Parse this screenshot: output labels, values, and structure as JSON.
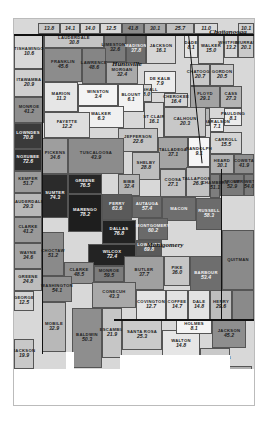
{
  "map": {
    "title": "Alabama counties choropleth",
    "cities": [
      {
        "name": "Chattanooga",
        "x": 214,
        "y": 13
      },
      {
        "name": "Huntsville",
        "x": 113,
        "y": 45
      },
      {
        "name": "Montgomery",
        "x": 151,
        "y": 226
      }
    ],
    "regions": [
      {
        "name": "",
        "value": "13.8",
        "x": 24,
        "y": 4,
        "w": 22,
        "h": 11,
        "fill": "#c8c8c8"
      },
      {
        "name": "",
        "value": "14.1",
        "x": 46,
        "y": 4,
        "w": 20,
        "h": 11,
        "fill": "#d0d0d0"
      },
      {
        "name": "",
        "value": "14.0",
        "x": 66,
        "y": 4,
        "w": 20,
        "h": 11,
        "fill": "#d4d4d4"
      },
      {
        "name": "",
        "value": "12.5",
        "x": 86,
        "y": 4,
        "w": 22,
        "h": 11,
        "fill": "#d8d8d8"
      },
      {
        "name": "",
        "value": "41.8",
        "x": 108,
        "y": 4,
        "w": 22,
        "h": 11,
        "fill": "#8a8a8a"
      },
      {
        "name": "",
        "value": "30.1",
        "x": 130,
        "y": 4,
        "w": 22,
        "h": 11,
        "fill": "#a8a8a8"
      },
      {
        "name": "",
        "value": "25.7",
        "x": 152,
        "y": 4,
        "w": 28,
        "h": 11,
        "fill": "#c0c0c0"
      },
      {
        "name": "",
        "value": "11.0",
        "x": 180,
        "y": 4,
        "w": 24,
        "h": 11,
        "fill": "#d8d8d8"
      },
      {
        "name": "",
        "value": "10.1",
        "x": 224,
        "y": 4,
        "w": 16,
        "h": 11,
        "fill": "#d0d0d0"
      },
      {
        "name": "TISHAMINGO",
        "value": "10.6",
        "x": 0,
        "y": 15,
        "w": 30,
        "h": 35,
        "fill": "#d8d8d8"
      },
      {
        "name": "ITAWAMBA",
        "value": "20.9",
        "x": 0,
        "y": 50,
        "w": 30,
        "h": 28,
        "fill": "#cfcfcf"
      },
      {
        "name": "MONROE",
        "value": "41.2",
        "x": 0,
        "y": 78,
        "w": 30,
        "h": 26,
        "fill": "#8e8e8e"
      },
      {
        "name": "LOWNDES",
        "value": "70.8",
        "x": 0,
        "y": 104,
        "w": 28,
        "h": 26,
        "fill": "#3a3a3a"
      },
      {
        "name": "NOXUBEE",
        "value": "72.6",
        "x": 0,
        "y": 130,
        "w": 28,
        "h": 22,
        "fill": "#2e2e2e"
      },
      {
        "name": "KEMPER",
        "value": "51.7",
        "x": 0,
        "y": 152,
        "w": 28,
        "h": 22,
        "fill": "#9a9a9a"
      },
      {
        "name": "LAUDERDALE",
        "value": "29.3",
        "x": 0,
        "y": 174,
        "w": 28,
        "h": 24,
        "fill": "#b8b8b8"
      },
      {
        "name": "CLARKE",
        "value": "41.2",
        "x": 0,
        "y": 198,
        "w": 28,
        "h": 26,
        "fill": "#999999"
      },
      {
        "name": "WAYNE",
        "value": "34.6",
        "x": 0,
        "y": 224,
        "w": 28,
        "h": 26,
        "fill": "#a4a4a4"
      },
      {
        "name": "GREENE",
        "value": "24.8",
        "x": 0,
        "y": 250,
        "w": 28,
        "h": 22,
        "fill": "#bdbdbd"
      },
      {
        "name": "GEORGE",
        "value": "12.5",
        "x": 0,
        "y": 272,
        "w": 20,
        "h": 20,
        "fill": "#d4d4d4"
      },
      {
        "name": "JACKSON",
        "value": "19.9",
        "x": 0,
        "y": 320,
        "w": 20,
        "h": 30,
        "fill": "#c8c8c8"
      },
      {
        "name": "LAUDERDALE",
        "value": "30.8",
        "x": 30,
        "y": 15,
        "w": 60,
        "h": 14,
        "fill": "#c4c4c4"
      },
      {
        "name": "LIMESTONE",
        "value": "32.6",
        "x": 90,
        "y": 15,
        "w": 22,
        "h": 28,
        "fill": "#7c7c7c"
      },
      {
        "name": "MADISON",
        "value": "37.8",
        "x": 112,
        "y": 15,
        "w": 20,
        "h": 30,
        "fill": "#6e6e6e"
      },
      {
        "name": "JACKSON",
        "value": "16.1",
        "x": 132,
        "y": 15,
        "w": 30,
        "h": 30,
        "fill": "#d6d6d6"
      },
      {
        "name": "DADE",
        "value": "8.1",
        "x": 170,
        "y": 15,
        "w": 14,
        "h": 24,
        "fill": "#e4e4e4"
      },
      {
        "name": "WALKER",
        "value": "15.0",
        "x": 184,
        "y": 15,
        "w": 26,
        "h": 30,
        "fill": "#d6d6d6"
      },
      {
        "name": "WHITFIELD",
        "value": "13.2",
        "x": 210,
        "y": 15,
        "w": 14,
        "h": 24,
        "fill": "#d8d8d8"
      },
      {
        "name": "MURRAY",
        "value": "20.1",
        "x": 224,
        "y": 15,
        "w": 16,
        "h": 24,
        "fill": "#cacaca"
      },
      {
        "name": "FRANKLIN",
        "value": "45.6",
        "x": 30,
        "y": 29,
        "w": 38,
        "h": 34,
        "fill": "#8c8c8c"
      },
      {
        "name": "LAWRENCE",
        "value": "48.6",
        "x": 68,
        "y": 29,
        "w": 24,
        "h": 36,
        "fill": "#858585"
      },
      {
        "name": "MORGAN",
        "value": "32.4",
        "x": 92,
        "y": 43,
        "w": 32,
        "h": 22,
        "fill": "#a9a9a9"
      },
      {
        "name": "DE KALB",
        "value": "7.9",
        "x": 130,
        "y": 52,
        "w": 32,
        "h": 22,
        "fill": "#ececec"
      },
      {
        "name": "MARSHALL",
        "value": "18.0",
        "x": 124,
        "y": 65,
        "w": 14,
        "h": 18,
        "fill": "#d3d3d3"
      },
      {
        "name": "CHEROKEE",
        "value": "16.4",
        "x": 150,
        "y": 74,
        "w": 24,
        "h": 14,
        "fill": "#d6d6d6"
      },
      {
        "name": "CHATOOGA",
        "value": "20.7",
        "x": 176,
        "y": 45,
        "w": 20,
        "h": 22,
        "fill": "#c8c8c8"
      },
      {
        "name": "GORDON",
        "value": "20.5",
        "x": 196,
        "y": 45,
        "w": 24,
        "h": 22,
        "fill": "#c9c9c9"
      },
      {
        "name": "FLOYD",
        "value": "29.1",
        "x": 176,
        "y": 67,
        "w": 30,
        "h": 22,
        "fill": "#a2a2a2"
      },
      {
        "name": "CASS",
        "value": "27.3",
        "x": 206,
        "y": 67,
        "w": 22,
        "h": 22,
        "fill": "#b4b4b4"
      },
      {
        "name": "PAULDING",
        "value": "8.1",
        "x": 210,
        "y": 89,
        "w": 18,
        "h": 18,
        "fill": "#ececec"
      },
      {
        "name": "POLK",
        "value": "26.8",
        "x": 176,
        "y": 89,
        "w": 20,
        "h": 18,
        "fill": "#b7b7b7"
      },
      {
        "name": "HARALSON",
        "value": "7.1",
        "x": 196,
        "y": 99,
        "w": 14,
        "h": 14,
        "fill": "#eeeeee"
      },
      {
        "name": "CARROLL",
        "value": "15.5",
        "x": 196,
        "y": 113,
        "w": 32,
        "h": 22,
        "fill": "#d4d4d4"
      },
      {
        "name": "HEARD",
        "value": "30.1",
        "x": 196,
        "y": 135,
        "w": 24,
        "h": 20,
        "fill": "#b0b0b0"
      },
      {
        "name": "COWETA",
        "value": "41.9",
        "x": 220,
        "y": 135,
        "w": 20,
        "h": 20,
        "fill": "#8e8e8e"
      },
      {
        "name": "TROUP",
        "value": "52.9",
        "x": 206,
        "y": 155,
        "w": 24,
        "h": 22,
        "fill": "#7a7a7a"
      },
      {
        "name": "MERIWETHER",
        "value": "54.0",
        "x": 230,
        "y": 155,
        "w": 10,
        "h": 22,
        "fill": "#7a7a7a"
      },
      {
        "name": "MARION",
        "value": "11.3",
        "x": 30,
        "y": 63,
        "w": 34,
        "h": 30,
        "fill": "#e6e6e6"
      },
      {
        "name": "WINSTON",
        "value": "3.4",
        "x": 64,
        "y": 65,
        "w": 40,
        "h": 22,
        "fill": "#f4f4f4"
      },
      {
        "name": "BLOUNT",
        "value": "6.1",
        "x": 104,
        "y": 65,
        "w": 26,
        "h": 28,
        "fill": "#f2f2f2"
      },
      {
        "name": "WALKER",
        "value": "6.3",
        "x": 64,
        "y": 87,
        "w": 46,
        "h": 22,
        "fill": "#f0f0f0"
      },
      {
        "name": "FAYETTE",
        "value": "12.2",
        "x": 30,
        "y": 93,
        "w": 46,
        "h": 26,
        "fill": "#dedede"
      },
      {
        "name": "ST CLAIR",
        "value": "16.1",
        "x": 130,
        "y": 83,
        "w": 20,
        "h": 36,
        "fill": "#d9d9d9"
      },
      {
        "name": "CALHOUN",
        "value": "20.3",
        "x": 150,
        "y": 88,
        "w": 42,
        "h": 30,
        "fill": "#c8c8c8"
      },
      {
        "name": "JEFFERSON",
        "value": "22.6",
        "x": 104,
        "y": 109,
        "w": 40,
        "h": 24,
        "fill": "#c4c4c4"
      },
      {
        "name": "PICKENS",
        "value": "34.6",
        "x": 28,
        "y": 119,
        "w": 26,
        "h": 36,
        "fill": "#9e9e9e"
      },
      {
        "name": "TUSCALOOSA",
        "value": "43.9",
        "x": 54,
        "y": 119,
        "w": 56,
        "h": 36,
        "fill": "#8c8c8c"
      },
      {
        "name": "TALLADEGA",
        "value": "37.1",
        "x": 144,
        "y": 118,
        "w": 30,
        "h": 32,
        "fill": "#a4a4a4"
      },
      {
        "name": "RANDOLPH",
        "value": "9.1",
        "x": 174,
        "y": 118,
        "w": 22,
        "h": 30,
        "fill": "#f6f6f6"
      },
      {
        "name": "SHELBY",
        "value": "28.8",
        "x": 118,
        "y": 133,
        "w": 28,
        "h": 28,
        "fill": "#bdbdbd"
      },
      {
        "name": "BIBB",
        "value": "32.4",
        "x": 104,
        "y": 155,
        "w": 22,
        "h": 22,
        "fill": "#b4b4b4"
      },
      {
        "name": "COOSA",
        "value": "27.1",
        "x": 146,
        "y": 150,
        "w": 26,
        "h": 28,
        "fill": "#c2c2c2"
      },
      {
        "name": "TALLAPOOSA",
        "value": "26.9",
        "x": 172,
        "y": 148,
        "w": 24,
        "h": 30,
        "fill": "#c2c2c2"
      },
      {
        "name": "CHAMBERS",
        "value": "51.1",
        "x": 196,
        "y": 155,
        "w": 10,
        "h": 24,
        "fill": "#7e7e7e"
      },
      {
        "name": "GREENE",
        "value": "76.5",
        "x": 54,
        "y": 155,
        "w": 34,
        "h": 20,
        "fill": "#262626"
      },
      {
        "name": "SUMTER",
        "value": "74.3",
        "x": 28,
        "y": 155,
        "w": 26,
        "h": 44,
        "fill": "#2b2b2b"
      },
      {
        "name": "PERRY",
        "value": "63.6",
        "x": 88,
        "y": 175,
        "w": 30,
        "h": 26,
        "fill": "#5a5a5a"
      },
      {
        "name": "AUTAUGA",
        "value": "57.4",
        "x": 118,
        "y": 177,
        "w": 30,
        "h": 22,
        "fill": "#6a6a6a"
      },
      {
        "name": "MARENGO",
        "value": "78.2",
        "x": 54,
        "y": 175,
        "w": 34,
        "h": 38,
        "fill": "#1e1e1e"
      },
      {
        "name": "DALLAS",
        "value": "76.8",
        "x": 88,
        "y": 201,
        "w": 34,
        "h": 24,
        "fill": "#222222"
      },
      {
        "name": "MACON",
        "value": "",
        "x": 148,
        "y": 178,
        "w": 34,
        "h": 24,
        "fill": "#6e6e6e"
      },
      {
        "name": "RUSSELL",
        "value": "58.3",
        "x": 182,
        "y": 179,
        "w": 26,
        "h": 32,
        "fill": "#6c6c6c"
      },
      {
        "name": "MONTGOMERY",
        "value": "60.2",
        "x": 124,
        "y": 199,
        "w": 30,
        "h": 22,
        "fill": "#6a6a6a"
      },
      {
        "name": "LOWNDES",
        "value": "69.8",
        "x": 122,
        "y": 221,
        "w": 26,
        "h": 16,
        "fill": "#5a5a5a"
      },
      {
        "name": "WILCOX",
        "value": "72.4",
        "x": 74,
        "y": 225,
        "w": 48,
        "h": 22,
        "fill": "#232323"
      },
      {
        "name": "CHOCTAW",
        "value": "51.2",
        "x": 28,
        "y": 213,
        "w": 22,
        "h": 44,
        "fill": "#8a8a8a"
      },
      {
        "name": "CLARKE",
        "value": "48.5",
        "x": 50,
        "y": 243,
        "w": 30,
        "h": 22,
        "fill": "#909090"
      },
      {
        "name": "MONROE",
        "value": "59.5",
        "x": 80,
        "y": 247,
        "w": 30,
        "h": 16,
        "fill": "#7c7c7c"
      },
      {
        "name": "BUTLER",
        "value": "37.7",
        "x": 110,
        "y": 237,
        "w": 40,
        "h": 34,
        "fill": "#a0a0a0"
      },
      {
        "name": "PIKE",
        "value": "36.0",
        "x": 150,
        "y": 237,
        "w": 26,
        "h": 30,
        "fill": "#c6c6c6"
      },
      {
        "name": "BARBOUR",
        "value": "53.4",
        "x": 176,
        "y": 237,
        "w": 32,
        "h": 40,
        "fill": "#6e6e6e"
      },
      {
        "name": "QUITMAN",
        "value": "",
        "x": 208,
        "y": 211,
        "w": 32,
        "h": 60,
        "fill": "#8a8a8a"
      },
      {
        "name": "WASHINGTON",
        "value": "54.1",
        "x": 28,
        "y": 257,
        "w": 30,
        "h": 26,
        "fill": "#8e8e8e"
      },
      {
        "name": "CONECUH",
        "value": "43.3",
        "x": 78,
        "y": 263,
        "w": 44,
        "h": 26,
        "fill": "#a8a8a8"
      },
      {
        "name": "COVINGTON",
        "value": "12.7",
        "x": 122,
        "y": 271,
        "w": 30,
        "h": 30,
        "fill": "#e4e4e4"
      },
      {
        "name": "COFFEE",
        "value": "14.7",
        "x": 152,
        "y": 271,
        "w": 22,
        "h": 30,
        "fill": "#e2e2e2"
      },
      {
        "name": "DALE",
        "value": "14.8",
        "x": 174,
        "y": 271,
        "w": 22,
        "h": 30,
        "fill": "#e2e2e2"
      },
      {
        "name": "HENRY",
        "value": "29.6",
        "x": 196,
        "y": 271,
        "w": 22,
        "h": 30,
        "fill": "#bdbdbd"
      },
      {
        "name": "",
        "value": "",
        "x": 218,
        "y": 271,
        "w": 22,
        "h": 30,
        "fill": "#8a8a8a"
      },
      {
        "name": "MOBILE",
        "value": "32.9",
        "x": 28,
        "y": 283,
        "w": 24,
        "h": 50,
        "fill": "#b8b8b8"
      },
      {
        "name": "BALDWIN",
        "value": "50.3",
        "x": 58,
        "y": 289,
        "w": 30,
        "h": 60,
        "fill": "#8e8e8e"
      },
      {
        "name": "ESCAMBIA",
        "value": "21.9",
        "x": 88,
        "y": 289,
        "w": 20,
        "h": 50,
        "fill": "#c6c6c6"
      },
      {
        "name": "SANTA ROSA",
        "value": "25.3",
        "x": 108,
        "y": 301,
        "w": 40,
        "h": 30,
        "fill": "#cacaca"
      },
      {
        "name": "WALTON",
        "value": "14.8",
        "x": 148,
        "y": 311,
        "w": 38,
        "h": 28,
        "fill": "#e6e6e6"
      },
      {
        "name": "HOLMES",
        "value": "8.1",
        "x": 162,
        "y": 301,
        "w": 36,
        "h": 14,
        "fill": "#f4f4f4"
      },
      {
        "name": "JACKSON",
        "value": "45.2",
        "x": 198,
        "y": 301,
        "w": 34,
        "h": 28,
        "fill": "#8e8e8e"
      },
      {
        "name": "WASHINGTON",
        "value": "22.1",
        "x": 186,
        "y": 329,
        "w": 30,
        "h": 26,
        "fill": "#c9c9c9"
      },
      {
        "name": "CALHOUN",
        "value": "36.8",
        "x": 214,
        "y": 347,
        "w": 24,
        "h": 20,
        "fill": "#b0b0b0"
      }
    ],
    "gulf_shapes": [
      {
        "x": 52,
        "y": 333,
        "w": 8,
        "h": 53
      },
      {
        "x": 0,
        "y": 350,
        "w": 240,
        "h": 36
      },
      {
        "x": 106,
        "y": 336,
        "w": 110,
        "h": 14
      }
    ]
  }
}
